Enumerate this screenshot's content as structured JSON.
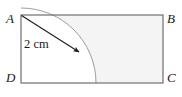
{
  "figure": {
    "vertices": [
      {
        "id": "A",
        "label": "A",
        "position": "top-left"
      },
      {
        "id": "B",
        "label": "B",
        "position": "top-right"
      },
      {
        "id": "C",
        "label": "C",
        "position": "bottom-right"
      },
      {
        "id": "D",
        "label": "D",
        "position": "bottom-left"
      }
    ],
    "measurement": {
      "label": "2 cm",
      "value": 2,
      "unit": "cm",
      "describes": "radius-arrow-from-D-to-arc"
    },
    "colors": {
      "outline": "#6b6b6b",
      "shaded_region": "#f4f4f4",
      "arc_stroke": "#9a9a9a",
      "arrow": "#1a1a1a",
      "text": "#1a1a1a",
      "background": "#ffffff"
    },
    "geometry": {
      "rect": {
        "x": 21,
        "y": 15,
        "width": 142,
        "height": 68
      },
      "arc": {
        "center_x": 21,
        "center_y": 83,
        "radius": 75
      },
      "arrow": {
        "x1": 21,
        "y1": 15,
        "x2": 80,
        "y2": 53
      }
    }
  }
}
